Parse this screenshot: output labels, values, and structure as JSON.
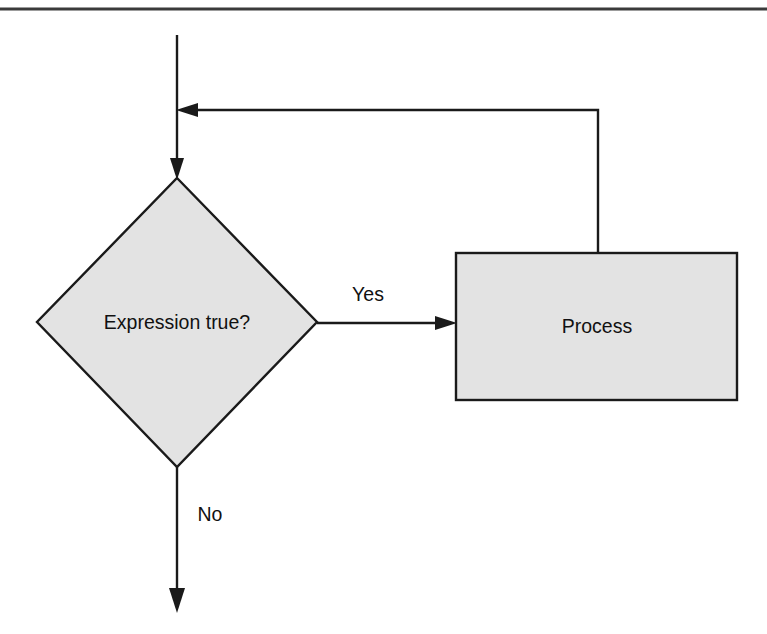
{
  "figure": {
    "kind": "flowchart",
    "background_color": "#ffffff"
  },
  "style": {
    "shape_fill": "#e3e3e3",
    "line_color": "#1a1a1a",
    "rule_color": "#3b3b3b",
    "text_color": "#111111"
  },
  "top_rule": {
    "name": "horizontal-rule",
    "x1": 0,
    "y1": 9,
    "x2": 767,
    "y2": 9
  },
  "nodes": [
    {
      "id": "decision",
      "shape": "diamond",
      "label": "Expression true?",
      "cx": 177,
      "cy": 322,
      "half_width": 140,
      "half_height": 145
    },
    {
      "id": "process",
      "shape": "rectangle",
      "label": "Process",
      "x": 456,
      "y": 253,
      "width": 281,
      "height": 147,
      "label_cx": 597,
      "label_cy": 327
    }
  ],
  "edges": [
    {
      "id": "entry",
      "from": "start",
      "to": "decision",
      "label": "",
      "path": "M 177 35 L 177 170",
      "arrow_at": {
        "x": 177,
        "y": 178
      },
      "arrow_dir": "down"
    },
    {
      "id": "yes-branch",
      "from": "decision",
      "to": "process",
      "label": "Yes",
      "label_x": 368,
      "label_y": 295,
      "path": "M 317 323 L 448 323",
      "arrow_at": {
        "x": 456,
        "y": 323
      },
      "arrow_dir": "right"
    },
    {
      "id": "loop-back",
      "from": "process",
      "to": "decision",
      "label": "",
      "path": "M 598 253 L 598 110 L 186 110",
      "arrow_at": {
        "x": 178,
        "y": 110
      },
      "arrow_dir": "left"
    },
    {
      "id": "no-branch",
      "from": "decision",
      "to": "end",
      "label": "No",
      "label_x": 210,
      "label_y": 515,
      "path": "M 177 467 L 177 604",
      "arrow_at": {
        "x": 177,
        "y": 612
      },
      "arrow_dir": "down"
    }
  ],
  "labels": {
    "decision_text": "Expression true?",
    "process_text": "Process",
    "yes_text": "Yes",
    "no_text": "No"
  }
}
